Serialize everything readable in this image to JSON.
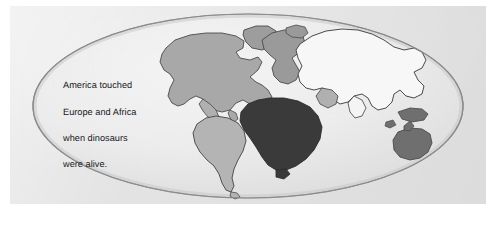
{
  "figure": {
    "kind": "world-map-illustration",
    "projection": "elliptical (Mollweide-style)",
    "caption_text": "America touched Europe and Africa when dinosaurs were alive.",
    "caption_lines": [
      "America touched",
      "Europe and Africa",
      "when dinosaurs",
      "were alive."
    ]
  },
  "colors": {
    "page_background": "#ffffff",
    "panel_background": "#e3e3e3",
    "ocean_fill": "#ececec",
    "ellipse_outline": "#8b8b8b",
    "coast_outline": "#4a4a4a",
    "caption_text": "#17171a",
    "north_america": "#a8a8a8",
    "south_america": "#b4b4b4",
    "africa": "#3a3a3a",
    "eurasia": "#f7f7f7",
    "greenland": "#9d9d9d",
    "europe": "#9a9a9a",
    "australia": "#6f6f6f",
    "southeast_islands": "#6f6f6f",
    "arabia": "#b0b0b0"
  },
  "landmasses": [
    {
      "name": "North America",
      "shade": "medium grey"
    },
    {
      "name": "Greenland",
      "shade": "medium grey"
    },
    {
      "name": "Europe",
      "shade": "medium grey"
    },
    {
      "name": "Eurasia / Asia",
      "shade": "near white"
    },
    {
      "name": "Africa",
      "shade": "dark charcoal"
    },
    {
      "name": "South America",
      "shade": "light grey"
    },
    {
      "name": "Australia",
      "shade": "dark grey"
    },
    {
      "name": "Southeast Asian islands",
      "shade": "dark grey"
    }
  ]
}
